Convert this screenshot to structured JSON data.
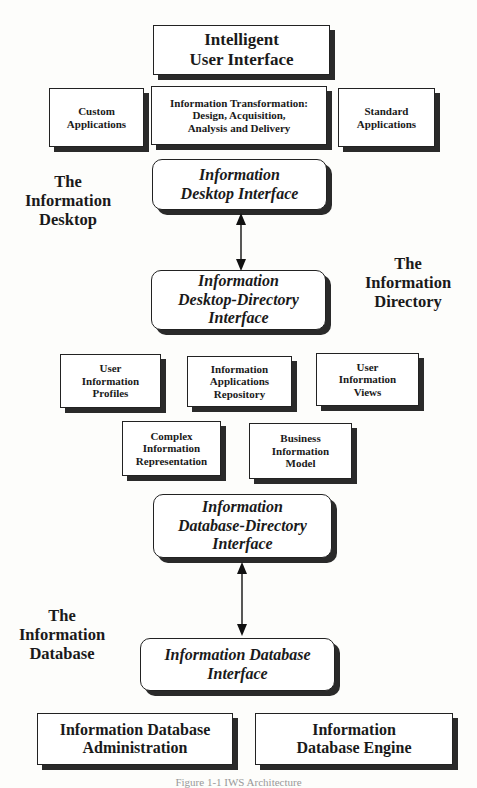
{
  "diagram": {
    "top": {
      "intelligent_ui": "Intelligent\nUser Interface"
    },
    "row1": {
      "custom_apps": "Custom\nApplications",
      "info_transformation": "Information Transformation:\nDesign,  Acquisition,\nAnalysis and Delivery",
      "standard_apps": "Standard\nApplications"
    },
    "desktop_interface": "Information\nDesktop Interface",
    "desktop_directory_interface": "Information\nDesktop-Directory\nInterface",
    "directory_row1": {
      "user_info_profiles": "User\nInformation\nProfiles",
      "info_apps_repository": "Information\nApplications\nRepository",
      "user_info_views": "User\nInformation\nViews"
    },
    "directory_row2": {
      "complex_info_rep": "Complex\nInformation\nRepresentation",
      "business_info_model": "Business\nInformation\nModel"
    },
    "database_directory_interface": "Information\nDatabase-Directory\nInterface",
    "database_interface": "Information Database\nInterface",
    "bottom": {
      "db_admin": "Information Database\nAdministration",
      "db_engine": "Information\nDatabase Engine"
    },
    "section_labels": {
      "desktop": "The\nInformation\nDesktop",
      "directory": "The\nInformation\nDirectory",
      "database": "The\nInformation\nDatabase"
    },
    "caption": "Figure 1-1  IWS Architecture"
  },
  "colors": {
    "box_border": "#222222",
    "shadow": "#2a2a2a",
    "background": "#fdfdfb"
  }
}
